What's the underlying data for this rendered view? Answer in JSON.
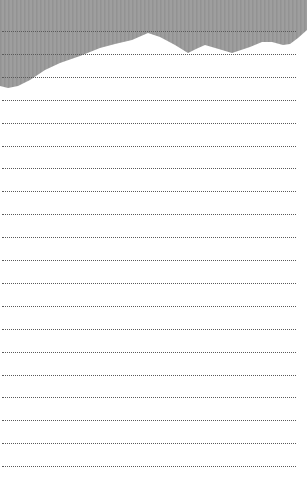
{
  "page": {
    "background_color": "#ffffff",
    "silhouette_color": "#9b9b9b",
    "line_color": "#5a5a5a",
    "line_style": "dotted",
    "line_count": 20,
    "first_line_y": 31,
    "line_spacing": 22.9
  }
}
